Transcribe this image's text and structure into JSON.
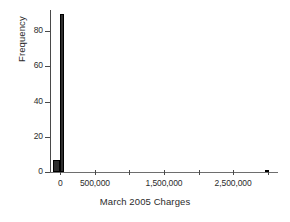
{
  "chart_data": {
    "type": "bar",
    "title": "",
    "subtitle": "",
    "xlabel": "March 2005 Charges",
    "ylabel": "Frequency",
    "xlim": [
      -150000,
      3150000
    ],
    "ylim": [
      0,
      92
    ],
    "grid": false,
    "legend": null,
    "x_ticks": [
      {
        "value": 0,
        "label": "0",
        "major": true
      },
      {
        "value": 500000,
        "label": "500,000",
        "major": true
      },
      {
        "value": 1000000,
        "label": "",
        "major": false
      },
      {
        "value": 1500000,
        "label": "1,500,000",
        "major": true
      },
      {
        "value": 2000000,
        "label": "",
        "major": false
      },
      {
        "value": 2500000,
        "label": "2,500,000",
        "major": true
      },
      {
        "value": 3000000,
        "label": "",
        "major": false
      }
    ],
    "y_ticks": [
      {
        "value": 0,
        "label": "0"
      },
      {
        "value": 20,
        "label": "20"
      },
      {
        "value": 40,
        "label": "40"
      },
      {
        "value": 60,
        "label": "60"
      },
      {
        "value": 80,
        "label": "80"
      }
    ],
    "bars": [
      {
        "name": "bin-below-zero",
        "x_start": -110000,
        "x_end": -5000,
        "value": 7
      },
      {
        "name": "bin-zero",
        "x_start": -5000,
        "x_end": 55000,
        "value": 90
      },
      {
        "name": "bin-far-right",
        "x_start": 2955000,
        "x_end": 3020000,
        "value": 1
      }
    ],
    "bar_color": "#2e2e2e",
    "axis_color": "#4a4a4a",
    "background": "#ffffff"
  }
}
